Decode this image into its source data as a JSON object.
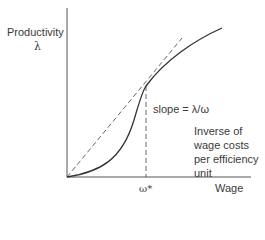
{
  "diagram": {
    "y_axis_label": "Productivity",
    "y_axis_symbol": "λ",
    "x_axis_label": "Wage",
    "x_tick_label": "ω*",
    "slope_label": "slope = λ/ω",
    "annotation_lines": [
      "Inverse of",
      "wage costs",
      "per efficiency",
      "unit"
    ],
    "curves": [
      {
        "name": "productivity-curve",
        "style": "solid",
        "description": "S-shaped effort/productivity function of wage"
      },
      {
        "name": "tangent-ray",
        "style": "dashed",
        "description": "Ray from origin tangent to curve at ω*"
      },
      {
        "name": "optimal-wage-guide",
        "style": "dashed",
        "description": "Vertical guide from tangency point to ω*"
      }
    ],
    "colors": {
      "line": "#333333",
      "dashed": "#666666",
      "axis": "#555555"
    }
  }
}
